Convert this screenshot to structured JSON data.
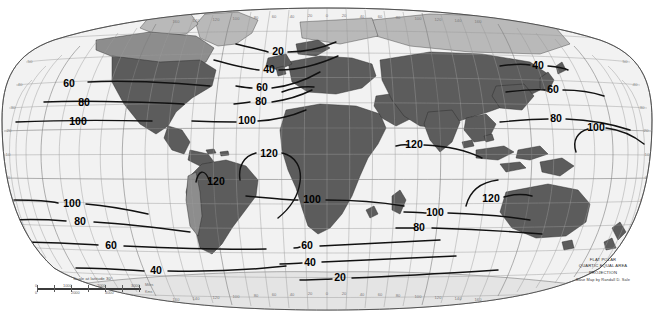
{
  "map": {
    "projection_note_lines": [
      "FLAT POLAR",
      "QUARTIC EQUAL AREA",
      "PROJECTION"
    ],
    "credit": "Base Map by Randall D. Sale",
    "scale": {
      "title": "Scale at latitude 30°",
      "miles": [
        "0",
        "1000",
        "2000",
        "3000"
      ],
      "miles_unit": "Miles",
      "kms": [
        "0",
        "2000",
        "4000"
      ],
      "kms_unit": "Kms"
    },
    "longitude_labels_bottom": [
      "160",
      "140",
      "120",
      "100",
      "80",
      "60",
      "40",
      "20",
      "0",
      "20",
      "40",
      "60",
      "80",
      "100",
      "120",
      "140",
      "160"
    ],
    "longitude_labels_top": [
      "160",
      "140",
      "120",
      "100",
      "80",
      "60",
      "40",
      "20",
      "0",
      "20",
      "40",
      "60",
      "80",
      "100",
      "120",
      "140",
      "160"
    ],
    "latitude_labels_left": [
      "60",
      "50",
      "40",
      "30",
      "20",
      "10",
      "0",
      "10",
      "20",
      "30",
      "40",
      "50",
      "60"
    ],
    "latitude_labels_right": [
      "60",
      "50",
      "40",
      "30",
      "20",
      "10",
      "0",
      "10",
      "20",
      "30",
      "40",
      "50",
      "60"
    ],
    "colors": {
      "ocean": "#f2f2f2",
      "land_dark": "#5c5c5c",
      "land_mid": "#8d8d8d",
      "land_light": "#b9b9b9",
      "contour": "#111111",
      "graticule": "#9a9a9a",
      "background": "#ffffff"
    }
  },
  "chart_data": {
    "type": "line",
    "title": "FLAT POLAR QUARTIC EQUAL AREA PROJECTION",
    "xlabel": "Longitude",
    "ylabel": "Latitude",
    "xlim": [
      -180,
      180
    ],
    "ylim": [
      -90,
      90
    ],
    "grid": true,
    "legend": "none",
    "contour_interval": 20,
    "contour_levels": [
      20,
      40,
      60,
      80,
      100,
      120
    ],
    "contour_labels": [
      {
        "value": "20",
        "x": 278,
        "y": 52
      },
      {
        "value": "40",
        "x": 269,
        "y": 70
      },
      {
        "value": "60",
        "x": 262,
        "y": 88
      },
      {
        "value": "80",
        "x": 261,
        "y": 102
      },
      {
        "value": "100",
        "x": 247,
        "y": 121
      },
      {
        "value": "60",
        "x": 69,
        "y": 84
      },
      {
        "value": "80",
        "x": 84,
        "y": 103
      },
      {
        "value": "100",
        "x": 78,
        "y": 122
      },
      {
        "value": "100",
        "x": 72,
        "y": 204
      },
      {
        "value": "80",
        "x": 80,
        "y": 222
      },
      {
        "value": "60",
        "x": 111,
        "y": 246
      },
      {
        "value": "40",
        "x": 156,
        "y": 271
      },
      {
        "value": "60",
        "x": 307,
        "y": 246
      },
      {
        "value": "40",
        "x": 310,
        "y": 263
      },
      {
        "value": "20",
        "x": 340,
        "y": 278
      },
      {
        "value": "120",
        "x": 269,
        "y": 154
      },
      {
        "value": "120",
        "x": 216,
        "y": 182
      },
      {
        "value": "100",
        "x": 312,
        "y": 200
      },
      {
        "value": "120",
        "x": 414,
        "y": 145
      },
      {
        "value": "120",
        "x": 491,
        "y": 199
      },
      {
        "value": "100",
        "x": 435,
        "y": 213
      },
      {
        "value": "80",
        "x": 419,
        "y": 228
      },
      {
        "value": "40",
        "x": 538,
        "y": 66
      },
      {
        "value": "60",
        "x": 553,
        "y": 90
      },
      {
        "value": "80",
        "x": 556,
        "y": 119
      },
      {
        "value": "100",
        "x": 596,
        "y": 128
      }
    ]
  }
}
